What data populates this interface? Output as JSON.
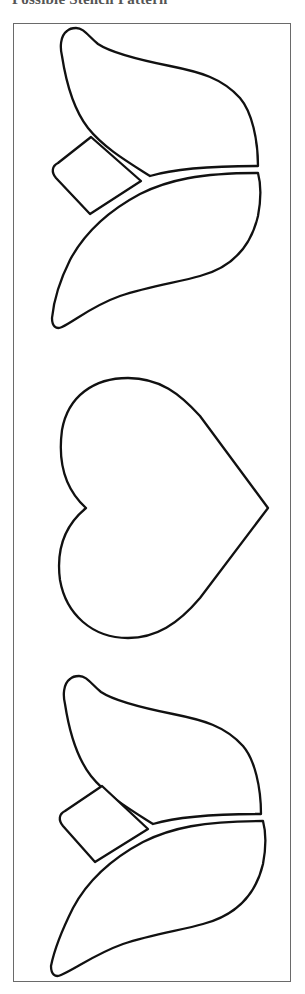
{
  "page": {
    "heading": "Possible Stencil Pattern"
  },
  "pattern": {
    "shapes": [
      {
        "name": "tulip-top",
        "parts": [
          "upper-petal",
          "lower-petal",
          "leaf"
        ]
      },
      {
        "name": "heart"
      },
      {
        "name": "tulip-bottom",
        "parts": [
          "upper-petal",
          "lower-petal",
          "leaf"
        ]
      }
    ],
    "line_color": "#111111",
    "frame_color": "#6a6a6a",
    "background_color": "#ffffff"
  }
}
